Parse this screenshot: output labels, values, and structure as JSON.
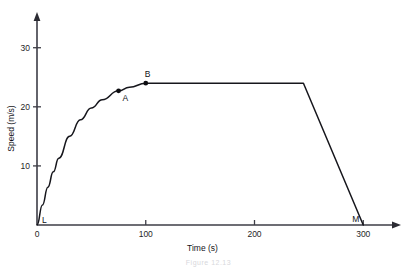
{
  "chart_data": {
    "type": "line",
    "title": "",
    "xlabel": "Time (s)",
    "ylabel": "Speed (m/s)",
    "xlim": [
      0,
      320
    ],
    "ylim": [
      0,
      33
    ],
    "xticks": [
      0,
      100,
      200,
      300
    ],
    "xtick_labels": [
      "0",
      "100",
      "200",
      "300"
    ],
    "yticks": [
      10,
      20,
      30
    ],
    "ytick_labels": [
      "10",
      "20",
      "30"
    ],
    "grid": false,
    "legend": "none",
    "series": [
      {
        "name": "speed-time",
        "description": "Curved acceleration from rest to 24 m/s, constant speed, then uniform deceleration to rest",
        "points": [
          [
            0,
            0
          ],
          [
            5,
            3.4
          ],
          [
            10,
            6.4
          ],
          [
            15,
            9.0
          ],
          [
            20,
            11.3
          ],
          [
            30,
            15.0
          ],
          [
            40,
            17.8
          ],
          [
            50,
            19.8
          ],
          [
            60,
            21.2
          ],
          [
            75,
            22.7
          ],
          [
            85,
            23.3
          ],
          [
            100,
            24.0
          ],
          [
            245,
            24.0
          ],
          [
            300,
            0
          ]
        ]
      }
    ],
    "annotations": [
      {
        "name": "L",
        "label": "L",
        "x": 0,
        "y": 0,
        "marker": false,
        "label_dx": 5,
        "label_dy": -2
      },
      {
        "name": "A",
        "label": "A",
        "x": 75,
        "y": 22.7,
        "marker": true,
        "label_dx": 4,
        "label_dy": 10
      },
      {
        "name": "B",
        "label": "B",
        "x": 100,
        "y": 24.0,
        "marker": true,
        "label_dx": -1,
        "label_dy": -6
      },
      {
        "name": "M",
        "label": "M",
        "x": 300,
        "y": 0,
        "marker": false,
        "label_dx": -11,
        "label_dy": -3
      }
    ]
  },
  "caption": {
    "ghost_text": "Figure 12.13"
  }
}
